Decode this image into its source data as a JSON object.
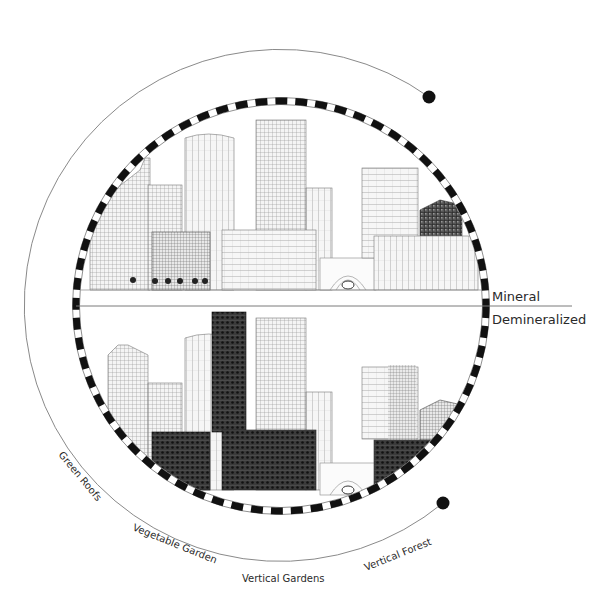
{
  "diagram": {
    "divider_labels": {
      "top": "Mineral",
      "bottom": "Demineralized"
    },
    "arc_labels": [
      {
        "text": "Green Roofs",
        "x": 85,
        "y": 470,
        "rotate": 50
      },
      {
        "text": "Vegetable Garden",
        "x": 168,
        "y": 546,
        "rotate": 22
      },
      {
        "text": "Vertical Gardens",
        "x": 300,
        "y": 580,
        "rotate": 0
      },
      {
        "text": "Vertical Forest",
        "x": 402,
        "y": 555,
        "rotate": -22
      }
    ],
    "colors": {
      "ink": "#111111",
      "line": "#7a7a7a",
      "building_light": "#8a8a8a",
      "building_dark": "#3a3a3a",
      "background": "#ffffff"
    },
    "ring": {
      "cx": 281,
      "cy": 306,
      "r": 205
    },
    "outer_arc": {
      "cx": 283,
      "cy": 306,
      "r": 256
    },
    "markers": [
      {
        "name": "top-end-dot",
        "x": 429,
        "y": 97
      },
      {
        "name": "bottom-end-dot",
        "x": 443,
        "y": 503
      }
    ]
  }
}
